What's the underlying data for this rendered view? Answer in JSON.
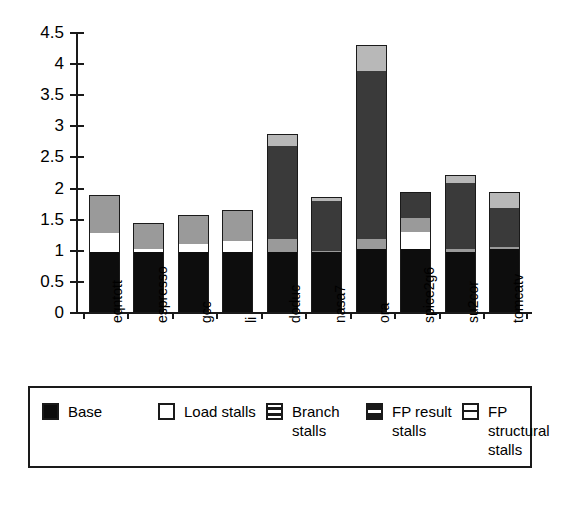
{
  "chart_data": {
    "type": "bar",
    "subtype": "stacked-bar",
    "title": "",
    "xlabel": "",
    "ylabel": "",
    "ylim": [
      0,
      4.5
    ],
    "ytick_labels": [
      "0",
      "0.5",
      "1",
      "1.5",
      "2",
      "2.5",
      "3",
      "3.5",
      "4",
      "4.5"
    ],
    "ytick_values": [
      0,
      0.5,
      1,
      1.5,
      2,
      2.5,
      3,
      3.5,
      4,
      4.5
    ],
    "grid": false,
    "legend_position": "bottom",
    "categories": [
      "eqntott",
      "espresso",
      "gcc",
      "li",
      "doduc",
      "nasa7",
      "ora",
      "spice2g6",
      "su2cor",
      "tomcatv"
    ],
    "series": [
      {
        "name": "Base",
        "color": "#0d0d0d",
        "values": [
          1.0,
          1.0,
          1.0,
          1.0,
          1.0,
          1.0,
          1.05,
          1.05,
          1.0,
          1.05
        ]
      },
      {
        "name": "Load stalls",
        "color": "#ffffff",
        "values": [
          0.3,
          0.05,
          0.13,
          0.18,
          0.0,
          0.0,
          0.0,
          0.27,
          0.0,
          0.0
        ]
      },
      {
        "name": "Branch stalls",
        "color": "#9a9a9a",
        "values": [
          0.6,
          0.4,
          0.44,
          0.48,
          0.2,
          0.02,
          0.15,
          0.23,
          0.05,
          0.02
        ]
      },
      {
        "name": "FP result stalls",
        "color": "#3a3a3a",
        "values": [
          0.0,
          0.0,
          0.0,
          0.0,
          1.5,
          0.8,
          2.7,
          0.39,
          1.05,
          0.63
        ]
      },
      {
        "name": "FP structural stalls",
        "color": "#b8b8b8",
        "values": [
          0.0,
          0.0,
          0.0,
          0.0,
          0.17,
          0.05,
          0.4,
          0.0,
          0.12,
          0.25
        ]
      }
    ],
    "totals": [
      1.9,
      1.45,
      1.57,
      1.66,
      2.87,
      1.87,
      4.3,
      1.94,
      2.22,
      1.95
    ]
  },
  "axis": {
    "ticks": [
      {
        "label": "4.5",
        "value": 4.5
      },
      {
        "label": "4",
        "value": 4
      },
      {
        "label": "3.5",
        "value": 3.5
      },
      {
        "label": "3",
        "value": 3
      },
      {
        "label": "2.5",
        "value": 2.5
      },
      {
        "label": "2",
        "value": 2
      },
      {
        "label": "1.5",
        "value": 1.5
      },
      {
        "label": "1",
        "value": 1
      },
      {
        "label": "0.5",
        "value": 0.5
      },
      {
        "label": "0",
        "value": 0
      }
    ]
  },
  "x_labels": [
    {
      "label": "eqntott"
    },
    {
      "label": "espresso"
    },
    {
      "label": "gcc"
    },
    {
      "label": "li"
    },
    {
      "label": "doduc"
    },
    {
      "label": "nasa7"
    },
    {
      "label": "ora"
    },
    {
      "label": "spice2g6"
    },
    {
      "label": "su2cor"
    },
    {
      "label": "tomcatv"
    }
  ],
  "legend": {
    "items": [
      {
        "label": "Base",
        "swatch": "solid-black-swatch-icon"
      },
      {
        "label": "Load stalls",
        "swatch": "empty-white-swatch-icon"
      },
      {
        "label": "Branch stalls",
        "swatch": "horizontal-stripe-swatch-icon"
      },
      {
        "label": "FP result stalls",
        "swatch": "thick-stripe-swatch-icon"
      },
      {
        "label": "FP structural stalls",
        "swatch": "single-line-swatch-icon"
      }
    ]
  }
}
